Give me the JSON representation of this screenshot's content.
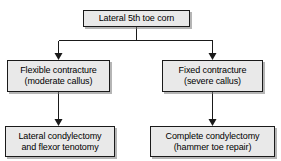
{
  "diagram": {
    "background_color": "#ffffff",
    "box_fill_color": "#e9e9e9",
    "box_border_color": "#1a1a1a",
    "connector_color": "#1a1a1a",
    "nodes": [
      {
        "id": "root",
        "line1": "Lateral 5th toe corn",
        "line2": ""
      },
      {
        "id": "flexible",
        "line1": "Flexible contracture",
        "line2": "(moderate callus)"
      },
      {
        "id": "fixed",
        "line1": "Fixed contracture",
        "line2": "(severe callus)"
      },
      {
        "id": "lateral-condylectomy",
        "line1": "Lateral condylectomy",
        "line2": "and flexor tenotomy"
      },
      {
        "id": "complete-condylectomy",
        "line1": "Complete condylectomy",
        "line2": "(hammer toe repair)"
      }
    ]
  }
}
